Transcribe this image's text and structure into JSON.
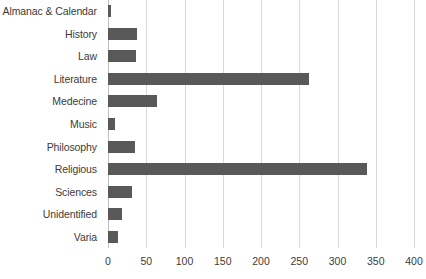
{
  "chart_data": {
    "type": "bar",
    "orientation": "horizontal",
    "title": "",
    "xlabel": "",
    "ylabel": "",
    "xlim": [
      0,
      400
    ],
    "xticks": [
      0,
      50,
      100,
      150,
      200,
      250,
      300,
      350,
      400
    ],
    "grid": true,
    "legend": null,
    "categories": [
      "Almanac & Calendar",
      "History",
      "Law",
      "Literature",
      "Medecine",
      "Music",
      "Philosophy",
      "Religious",
      "Sciences",
      "Unidentified",
      "Varia"
    ],
    "values": [
      4,
      38,
      36,
      263,
      64,
      9,
      35,
      338,
      32,
      18,
      13
    ],
    "series": [
      {
        "name": "Count",
        "values": [
          4,
          38,
          36,
          263,
          64,
          9,
          35,
          338,
          32,
          18,
          13
        ]
      }
    ]
  },
  "style": {
    "bar_color": "#595959",
    "gridline_color": "#d9d9d9",
    "axis_line_color": "#bfbfbf",
    "text_color": "#3b3b3b",
    "background": "#ffffff"
  }
}
